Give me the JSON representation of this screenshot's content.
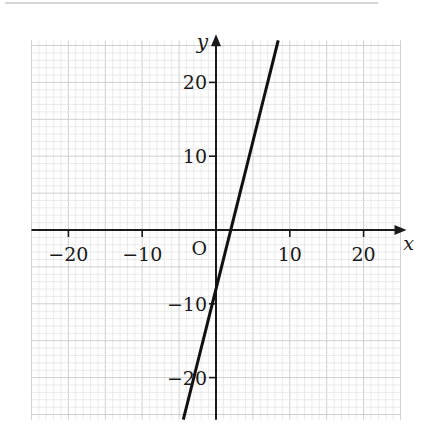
{
  "chart_data": {
    "type": "line",
    "title": "",
    "xlabel": "x",
    "ylabel": "y",
    "origin_label": "O",
    "xlim": [
      -25,
      25
    ],
    "ylim": [
      -25.7,
      25.7
    ],
    "grid": true,
    "grid_minor_step": 1,
    "grid_major_step": 5,
    "x_ticks": [
      -20,
      -10,
      10,
      20
    ],
    "x_tick_labels": [
      "−20",
      "−10",
      "10",
      "20"
    ],
    "y_ticks": [
      20,
      10,
      -10,
      -20
    ],
    "y_tick_labels": [
      "20",
      "10",
      "−10",
      "−20"
    ],
    "series": [
      {
        "name": "y = 4x - 8",
        "slope": 4,
        "intercept": -8,
        "points": [
          [
            -4.43,
            -25.7
          ],
          [
            8.43,
            25.7
          ]
        ],
        "x_intercept": 2,
        "y_intercept": -8
      }
    ],
    "legend": null
  },
  "colors": {
    "grid_minor": "#e4e4e4",
    "grid_major": "#cfcfcf",
    "axis": "#1a1a1a",
    "line": "#111111"
  }
}
